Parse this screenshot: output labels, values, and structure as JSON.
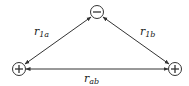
{
  "diagram": {
    "nodes": [
      {
        "id": "anion",
        "charge_symbol": "−",
        "label": "negative-charge",
        "x": 97,
        "y": 12
      },
      {
        "id": "cation_a",
        "charge_symbol": "+",
        "label": "positive-charge-a",
        "x": 19,
        "y": 69
      },
      {
        "id": "cation_b",
        "charge_symbol": "+",
        "label": "positive-charge-b",
        "x": 175,
        "y": 69
      }
    ],
    "edges": [
      {
        "from": "cation_a",
        "to": "anion",
        "label_main": "r",
        "label_sub": "1a"
      },
      {
        "from": "anion",
        "to": "cation_b",
        "label_main": "r",
        "label_sub": "1b"
      },
      {
        "from": "cation_a",
        "to": "cation_b",
        "label_main": "r",
        "label_sub": "ab"
      }
    ]
  }
}
